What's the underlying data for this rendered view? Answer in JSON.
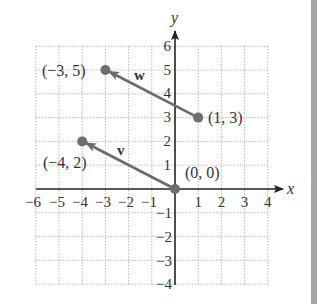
{
  "diagram": {
    "type": "coordinate-plane-vectors",
    "axes": {
      "x_label": "x",
      "y_label": "y",
      "x_range": [
        -6,
        4
      ],
      "y_range": [
        -4,
        6
      ],
      "x_ticks": [
        "−6",
        "−5",
        "−4",
        "−3",
        "−2",
        "−1",
        "1",
        "2",
        "3",
        "4"
      ],
      "y_ticks_pos": [
        "1",
        "2",
        "3",
        "4",
        "5",
        "6"
      ],
      "y_ticks_neg": [
        "−1",
        "−2",
        "−3",
        "−4"
      ]
    },
    "vectors": [
      {
        "name": "w",
        "from": [
          1,
          3
        ],
        "to": [
          -3,
          5
        ]
      },
      {
        "name": "v",
        "from": [
          0,
          0
        ],
        "to": [
          -4,
          2
        ]
      }
    ],
    "points": [
      {
        "label": "(−3, 5)",
        "x": -3,
        "y": 5
      },
      {
        "label": "(1, 3)",
        "x": 1,
        "y": 3
      },
      {
        "label": "(−4, 2)",
        "x": -4,
        "y": 2
      },
      {
        "label": "(0, 0)",
        "x": 0,
        "y": 0
      }
    ],
    "colors": {
      "vector": "#6b6b6b",
      "point": "#6e6e6e",
      "axis": "#222222",
      "grid": "#b8b8b8",
      "side_strip": "#a6a6a6"
    }
  }
}
